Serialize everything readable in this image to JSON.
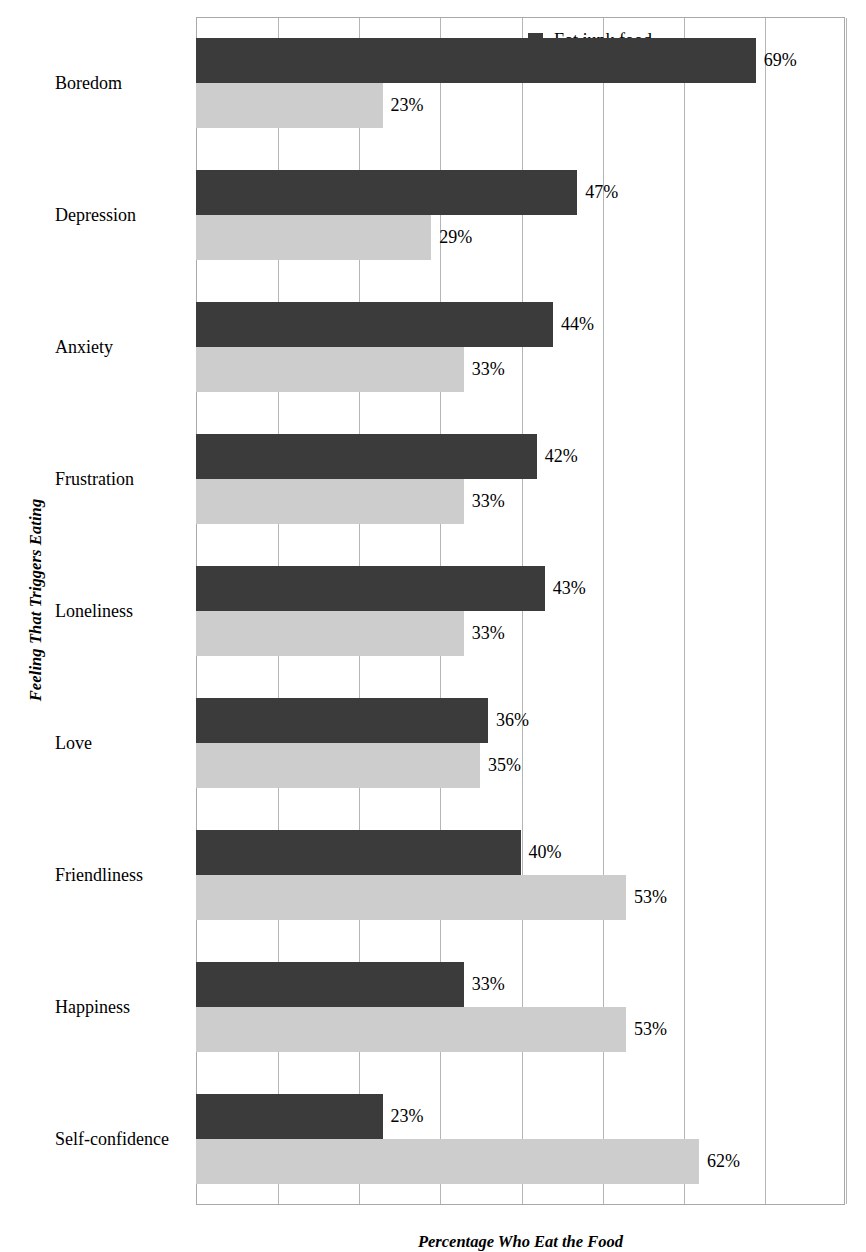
{
  "chart_data": {
    "type": "bar",
    "orientation": "horizontal",
    "title": "",
    "xlabel": "Percentage Who Eat the Food",
    "ylabel": "Feeling That Triggers Eating",
    "categories": [
      "Boredom",
      "Depression",
      "Anxiety",
      "Frustration",
      "Loneliness",
      "Love",
      "Friendliness",
      "Happiness",
      "Self-confidence"
    ],
    "series": [
      {
        "name": "Eat junk food",
        "color": "#3b3b3b",
        "values": [
          69,
          47,
          44,
          42,
          43,
          36,
          40,
          33,
          23
        ],
        "labels": [
          "69%",
          "47%",
          "44%",
          "42%",
          "43%",
          "36%",
          "40%",
          "33%",
          "23%"
        ]
      },
      {
        "name": "Eat nutritional food only",
        "color": "#cdcdcd",
        "values": [
          23,
          29,
          33,
          33,
          33,
          35,
          53,
          53,
          62
        ],
        "labels": [
          "23%",
          "29%",
          "33%",
          "33%",
          "33%",
          "35%",
          "53%",
          "53%",
          "62%"
        ]
      }
    ],
    "xlim": [
      0,
      80
    ],
    "xticks": [
      0,
      10,
      20,
      30,
      40,
      50,
      60,
      70,
      80
    ],
    "grid": true,
    "tick_labels_visible": false,
    "legend_position": "top-right"
  },
  "legend": {
    "items": [
      {
        "label": "Eat junk food",
        "color": "#3b3b3b"
      },
      {
        "label": "Eat nutritional food only",
        "color": "#d2d2d2"
      }
    ]
  }
}
